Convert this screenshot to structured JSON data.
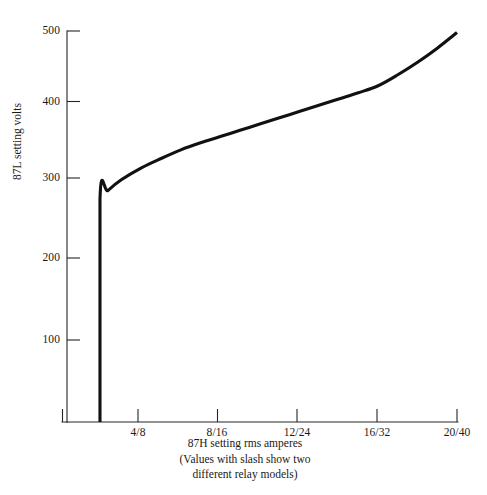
{
  "figure": {
    "background_color": "#ffffff",
    "ink_color": "#111111",
    "axis_color": "#262626"
  },
  "axis_labels": {
    "y": "87L setting volts",
    "x_primary": "87H setting rms amperes",
    "x_note_line1": "(Values with slash show two",
    "x_note_line2": "different relay models)"
  },
  "y_ticks": [
    {
      "label": "500",
      "value": 500
    },
    {
      "label": "400",
      "value": 400
    },
    {
      "label": "300",
      "value": 300
    },
    {
      "label": "200",
      "value": 200
    },
    {
      "label": "100",
      "value": 100
    }
  ],
  "x_ticks": [
    {
      "label": "4/8",
      "value": 4
    },
    {
      "label": "8/16",
      "value": 8
    },
    {
      "label": "12/24",
      "value": 12
    },
    {
      "label": "16/32",
      "value": 16
    },
    {
      "label": "20/40",
      "value": 20
    }
  ],
  "chart_data": {
    "type": "line",
    "title": "",
    "xlabel": "87H setting rms amperes",
    "ylabel": "87L setting volts",
    "xlim": [
      0,
      20
    ],
    "ylim": [
      0,
      500
    ],
    "grid": false,
    "legend": "none",
    "xtick_labels": [
      "4/8",
      "8/16",
      "12/24",
      "16/32",
      "20/40"
    ],
    "xtick_values": [
      4,
      8,
      12,
      16,
      20
    ],
    "ytick_values": [
      100,
      200,
      300,
      400,
      500
    ],
    "annotations": [
      "Values with slash show two different relay models"
    ],
    "series": [
      {
        "name": "87L setting volts vs 87H setting rms amperes",
        "x": [
          1.9,
          1.9,
          2.3,
          3.0,
          4.0,
          5.0,
          6.0,
          7.0,
          8.0,
          9.0,
          10.0,
          11.0,
          12.0,
          13.0,
          14.0,
          15.0,
          16.0,
          17.0,
          18.0,
          19.0,
          20.0
        ],
        "y": [
          0,
          285,
          296,
          310,
          325,
          337,
          348,
          357,
          365,
          373,
          381,
          389,
          397,
          405,
          413,
          421,
          430,
          444,
          460,
          478,
          498
        ]
      }
    ]
  }
}
